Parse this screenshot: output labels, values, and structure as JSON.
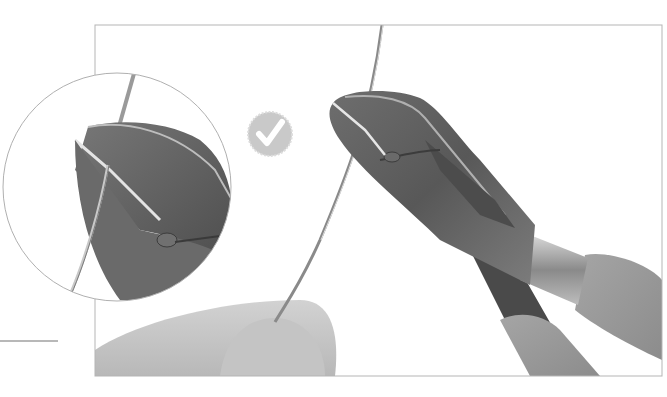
{
  "figure": {
    "check_badge": {
      "icon": "checkmark-icon",
      "color": "#c9c9c9"
    },
    "frame_color": "#b5b5b5",
    "inset_circle_color": "#b0b0b0",
    "pointer_line_color": "#9e9e9e",
    "colors": {
      "metal_dark": "#5a5a5a",
      "metal_mid": "#7a7a7a",
      "metal_light": "#a8a8a8",
      "handle_grip": "#9a9a9a",
      "finger": "#c8c8c8",
      "wire": "#8a8a8a"
    }
  }
}
